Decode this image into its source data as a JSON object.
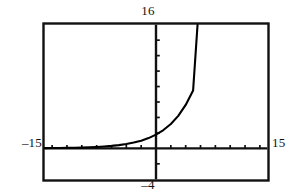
{
  "figure": {
    "kind": "graphing-calculator-viewport",
    "labels": {
      "top": "16",
      "bottom": "–4",
      "left": "–15",
      "right": "15"
    }
  },
  "chart_data": {
    "type": "line",
    "title": "",
    "subtitle": "",
    "xlabel": "",
    "ylabel": "",
    "grid": false,
    "legend": null,
    "legend_position": "none",
    "xlim": [
      -15,
      15
    ],
    "ylim": [
      -4,
      16
    ],
    "axis_tick_labels": {
      "xmin": "–15",
      "xmax": "15",
      "ymin": "–4",
      "ymax": "16"
    },
    "x_tick_step": 2,
    "y_tick_step": 2,
    "x_ticks": [
      -14,
      -12,
      -10,
      -8,
      -6,
      -4,
      -2,
      0,
      2,
      4,
      6,
      8,
      10,
      12,
      14
    ],
    "y_ticks": [
      -2,
      0,
      2,
      4,
      6,
      8,
      10,
      12,
      14
    ],
    "series": [
      {
        "name": "exponential curve",
        "color": "#000000",
        "x": [
          -15,
          -14,
          -13,
          -12,
          -11,
          -10,
          -9,
          -8,
          -7,
          -6,
          -5,
          -4,
          -3,
          -2,
          -1,
          0,
          1,
          2,
          3,
          4,
          5,
          5.6
        ],
        "y": [
          0.03,
          0.04,
          0.05,
          0.06,
          0.08,
          0.1,
          0.14,
          0.18,
          0.24,
          0.32,
          0.42,
          0.56,
          0.75,
          1.0,
          1.33,
          1.78,
          2.37,
          3.16,
          4.21,
          5.62,
          7.49,
          16.0
        ]
      }
    ],
    "annotations": []
  }
}
